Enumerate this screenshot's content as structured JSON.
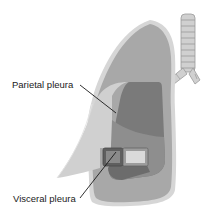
{
  "diagram": {
    "labels": [
      {
        "id": "parietal",
        "text": "Parietal pleura"
      },
      {
        "id": "visceral",
        "text": "Visceral pleura"
      }
    ],
    "structures": [
      "lung",
      "trachea",
      "bronchi",
      "parietal-pleura-cutaway",
      "visceral-pleura-cutaway"
    ],
    "colors": {
      "background": "#ffffff",
      "lung_rim": "#d6d6d6",
      "lung_body": "#a8a8a8",
      "parietal_layer": "#cfcfcf",
      "inner_dark": "#6f6f6f",
      "inner_mid": "#8c8c8c",
      "box_light": "#d9d9d9",
      "trachea": "#cccccc",
      "leader_line": "#1a1a1a"
    }
  }
}
